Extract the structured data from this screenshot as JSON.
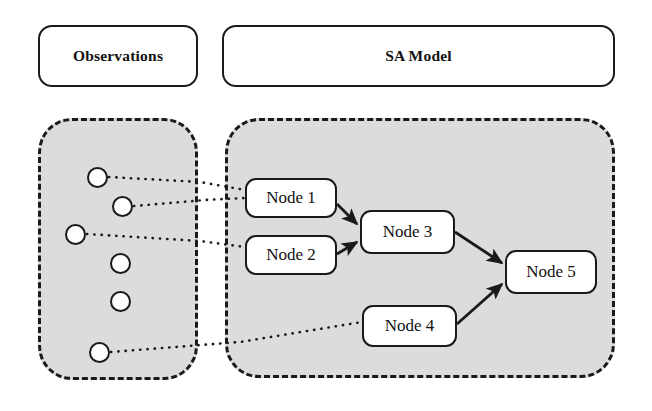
{
  "diagram": {
    "background_color": "#ffffff",
    "panel_fill_color": "#dcdcdc",
    "stroke_color": "#1a1a1a",
    "node_fill_color": "#ffffff"
  },
  "headers": {
    "observations": {
      "label": "Observations"
    },
    "sa_model": {
      "label": "SA Model"
    }
  },
  "observations_panel": {
    "name": "Observations",
    "border_style": "dashed",
    "circle_count": 6,
    "circles": [
      {
        "id": "obs-1",
        "label": "",
        "x": 87,
        "y": 167,
        "connected": true
      },
      {
        "id": "obs-2",
        "label": "",
        "x": 112,
        "y": 196,
        "connected": true
      },
      {
        "id": "obs-3",
        "label": "",
        "x": 65,
        "y": 224,
        "connected": true
      },
      {
        "id": "obs-4",
        "label": "",
        "x": 110,
        "y": 253,
        "connected": false
      },
      {
        "id": "obs-5",
        "label": "",
        "x": 110,
        "y": 291,
        "connected": false
      },
      {
        "id": "obs-6",
        "label": "",
        "x": 89,
        "y": 342,
        "connected": true
      }
    ]
  },
  "sa_model_panel": {
    "name": "SA Model",
    "border_style": "dashed",
    "nodes": [
      {
        "id": "node-1",
        "label": "Node 1"
      },
      {
        "id": "node-2",
        "label": "Node 2"
      },
      {
        "id": "node-3",
        "label": "Node 3"
      },
      {
        "id": "node-4",
        "label": "Node 4"
      },
      {
        "id": "node-5",
        "label": "Node 5"
      }
    ],
    "edges": [
      {
        "from": "node-1",
        "to": "node-3",
        "style": "solid-arrow"
      },
      {
        "from": "node-2",
        "to": "node-3",
        "style": "solid-arrow"
      },
      {
        "from": "node-3",
        "to": "node-5",
        "style": "solid-arrow"
      },
      {
        "from": "node-4",
        "to": "node-5",
        "style": "solid-arrow"
      }
    ]
  },
  "observation_links": [
    {
      "from": "obs-1",
      "to": "node-1",
      "style": "dotted"
    },
    {
      "from": "obs-2",
      "to": "node-1",
      "style": "dotted"
    },
    {
      "from": "obs-3",
      "to": "node-2",
      "style": "dotted"
    },
    {
      "from": "obs-6",
      "to": "node-4",
      "style": "dotted"
    }
  ]
}
